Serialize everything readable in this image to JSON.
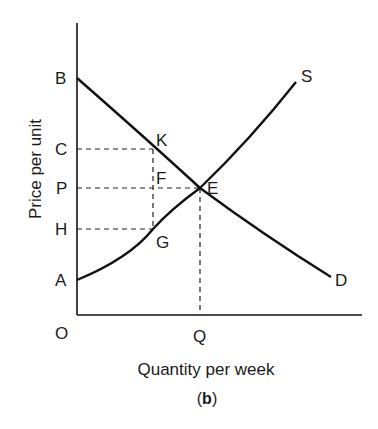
{
  "diagram": {
    "type": "supply-demand",
    "y_axis_title": "Price per unit",
    "x_axis_title": "Quantity per week",
    "caption_open": "(",
    "caption_letter": "b",
    "caption_close": ")",
    "origin_label": "O",
    "y_labels": {
      "B": "B",
      "C": "C",
      "P": "P",
      "H": "H",
      "A": "A"
    },
    "x_labels": {
      "Q": "Q"
    },
    "point_labels": {
      "K": "K",
      "F": "F",
      "E": "E",
      "G": "G"
    },
    "curve_labels": {
      "supply": "S",
      "demand": "D"
    },
    "colors": {
      "line": "#111111",
      "text": "#1a1a1a",
      "background": "#ffffff"
    }
  }
}
